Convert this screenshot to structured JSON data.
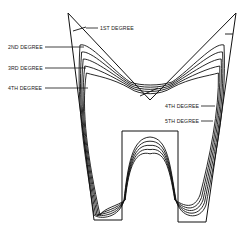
{
  "figure": {
    "line_color": "#111111",
    "background": "#ffffff"
  },
  "labels": [
    {
      "id": "first",
      "text": "1ST DEGREE"
    },
    {
      "id": "second",
      "text": "2ND DEGREE"
    },
    {
      "id": "third",
      "text": "3RD DEGREE"
    },
    {
      "id": "fourth_left",
      "text": "4TH DEGREE"
    },
    {
      "id": "fourth_right",
      "text": "4TH DEGREE"
    },
    {
      "id": "fifth",
      "text": "5TH DEGREE"
    }
  ],
  "degrees": [
    1,
    2,
    3,
    4,
    5,
    6
  ]
}
